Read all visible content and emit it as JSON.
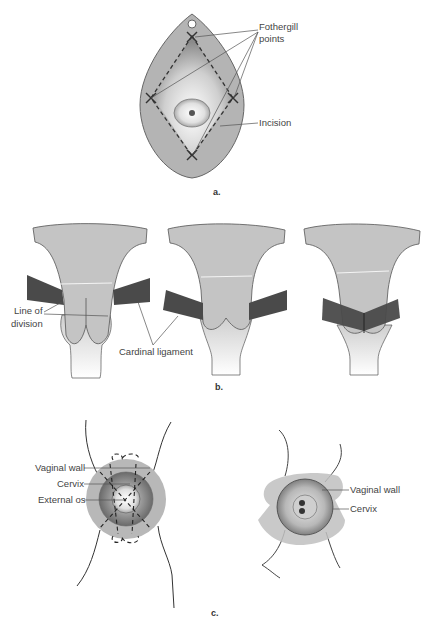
{
  "panel_a": {
    "caption": "a.",
    "labels": {
      "fothergill_1": "Fothergill",
      "fothergill_2": "points",
      "incision": "Incision"
    }
  },
  "panel_b": {
    "caption": "b.",
    "labels": {
      "line_of_1": "Line of",
      "line_of_2": "division",
      "cardinal_ligament": "Cardinal ligament"
    }
  },
  "panel_c": {
    "caption": "c.",
    "left_labels": {
      "vaginal_wall": "Vaginal wall",
      "cervix": "Cervix",
      "external_os": "External os"
    },
    "right_labels": {
      "vaginal_wall": "Vaginal wall",
      "cervix": "Cervix"
    }
  },
  "colors": {
    "tissue": "#c4c4c4",
    "ligament": "#4a4a4a",
    "outline": "#555555",
    "label": "#444444"
  }
}
